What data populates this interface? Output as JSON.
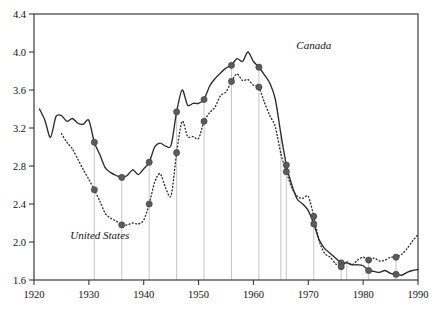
{
  "chart_data": {
    "type": "line",
    "title": "",
    "xlabel": "",
    "ylabel": "",
    "xlim": [
      1920,
      1990
    ],
    "ylim": [
      1.6,
      4.4
    ],
    "grid": false,
    "legend_position": "inline-annotation",
    "xticks": [
      1920,
      1930,
      1940,
      1950,
      1960,
      1970,
      1980,
      1990
    ],
    "xtick_labels": [
      "1920",
      "1930",
      "1940",
      "1950",
      "1960",
      "1970",
      "1980",
      "1990"
    ],
    "yticks": [
      1.6,
      2.0,
      2.4,
      2.8,
      3.2,
      3.6,
      4.0,
      4.4
    ],
    "ytick_labels": [
      "1.6",
      "2.0",
      "2.4",
      "2.8",
      "3.2",
      "3.6",
      "4.0",
      "4.4"
    ],
    "annotations": [
      {
        "text": "Canada",
        "x": 1971,
        "y": 4.03,
        "style": "italic"
      },
      {
        "text": "United States",
        "x": 1932,
        "y": 2.03,
        "style": "italic"
      }
    ],
    "series": [
      {
        "name": "Canada",
        "style": "solid",
        "color": "#2b2b2b",
        "x": [
          1921,
          1922,
          1923,
          1924,
          1925,
          1926,
          1927,
          1928,
          1929,
          1930,
          1931,
          1932,
          1933,
          1934,
          1935,
          1936,
          1937,
          1938,
          1939,
          1940,
          1941,
          1942,
          1943,
          1944,
          1945,
          1946,
          1947,
          1948,
          1949,
          1950,
          1951,
          1952,
          1953,
          1954,
          1955,
          1956,
          1957,
          1958,
          1959,
          1960,
          1961,
          1962,
          1963,
          1964,
          1965,
          1966,
          1967,
          1968,
          1969,
          1970,
          1971,
          1972,
          1973,
          1974,
          1975,
          1976,
          1977,
          1978,
          1979,
          1980,
          1981,
          1982,
          1983,
          1984,
          1985,
          1986,
          1987,
          1988,
          1989,
          1990
        ],
        "y": [
          3.4,
          3.28,
          3.1,
          3.32,
          3.33,
          3.27,
          3.3,
          3.25,
          3.24,
          3.28,
          3.05,
          2.92,
          2.78,
          2.73,
          2.7,
          2.68,
          2.7,
          2.76,
          2.71,
          2.77,
          2.84,
          3.0,
          3.04,
          3.01,
          3.02,
          3.37,
          3.6,
          3.44,
          3.46,
          3.46,
          3.5,
          3.64,
          3.72,
          3.78,
          3.83,
          3.86,
          3.93,
          3.9,
          4.0,
          3.9,
          3.84,
          3.76,
          3.67,
          3.5,
          3.14,
          2.81,
          2.6,
          2.45,
          2.4,
          2.33,
          2.19,
          2.02,
          1.93,
          1.88,
          1.83,
          1.78,
          1.78,
          1.76,
          1.76,
          1.75,
          1.7,
          1.69,
          1.68,
          1.7,
          1.67,
          1.66,
          1.65,
          1.68,
          1.7,
          1.71
        ]
      },
      {
        "name": "United States",
        "style": "dotted",
        "color": "#2b2b2b",
        "x": [
          1925,
          1926,
          1927,
          1928,
          1929,
          1930,
          1931,
          1932,
          1933,
          1934,
          1935,
          1936,
          1937,
          1938,
          1939,
          1940,
          1941,
          1942,
          1943,
          1944,
          1945,
          1946,
          1947,
          1948,
          1949,
          1950,
          1951,
          1952,
          1953,
          1954,
          1955,
          1956,
          1957,
          1958,
          1959,
          1960,
          1961,
          1962,
          1963,
          1964,
          1965,
          1966,
          1967,
          1968,
          1969,
          1970,
          1971,
          1972,
          1973,
          1974,
          1975,
          1976,
          1977,
          1978,
          1979,
          1980,
          1981,
          1982,
          1983,
          1984,
          1985,
          1986,
          1987,
          1988,
          1989,
          1990
        ],
        "y": [
          3.14,
          3.05,
          2.98,
          2.87,
          2.76,
          2.66,
          2.55,
          2.43,
          2.3,
          2.25,
          2.22,
          2.18,
          2.18,
          2.2,
          2.19,
          2.23,
          2.4,
          2.63,
          2.72,
          2.57,
          2.49,
          2.94,
          3.27,
          3.11,
          3.11,
          3.09,
          3.27,
          3.36,
          3.42,
          3.54,
          3.58,
          3.69,
          3.77,
          3.7,
          3.71,
          3.65,
          3.63,
          3.47,
          3.33,
          3.21,
          2.93,
          2.74,
          2.57,
          2.48,
          2.46,
          2.48,
          2.27,
          2.01,
          1.88,
          1.84,
          1.77,
          1.74,
          1.79,
          1.76,
          1.81,
          1.84,
          1.81,
          1.83,
          1.8,
          1.81,
          1.84,
          1.84,
          1.87,
          1.93,
          2.01,
          2.08
        ]
      }
    ],
    "markers": {
      "description": "Filled circular markers at approximately five-year interval observations on both series, several with faint vertical drop-lines to the x-axis",
      "canada_years": [
        1931,
        1936,
        1941,
        1946,
        1951,
        1956,
        1961,
        1966,
        1971,
        1976,
        1981,
        1986
      ],
      "united_states_years": [
        1931,
        1936,
        1941,
        1946,
        1951,
        1956,
        1961,
        1966,
        1971,
        1976,
        1981,
        1986
      ],
      "dropline_years": [
        1931,
        1936,
        1941,
        1946,
        1951,
        1956,
        1961,
        1965,
        1966,
        1971,
        1976,
        1977,
        1981,
        1986
      ]
    }
  },
  "figure": {
    "background_color": "#ffffff",
    "frame_color": "#3a3a3a",
    "line_color": "#2b2b2b",
    "marker_color": "#5c5c5c",
    "dropline_color": "#b9b9b9"
  }
}
